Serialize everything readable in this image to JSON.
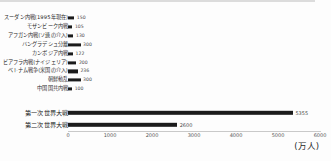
{
  "chart_data": {
    "type": "bar",
    "orientation": "horizontal",
    "title": "",
    "subtitle": "",
    "xlabel": "(万人)",
    "ylabel": "",
    "xlim": [
      0,
      6000
    ],
    "xticks": [
      "0",
      "1000",
      "2000",
      "3000",
      "4000",
      "5000",
      "6000"
    ],
    "grid": false,
    "legend": "none",
    "unit_note": "(万人)",
    "categories": [
      "スーダン内戦(1995年現在)",
      "モザンビーク内戦",
      "アフガン内戦(ソ連の介入)",
      "バングラデシュ分離",
      "カンボジア内戦",
      "ビアフラ内戦(ナイジェリア)",
      "ベトナム戦争(米国の介入)",
      "朝鮮動乱",
      "中国国共内戦",
      "第一次世界大戦",
      "第二次世界大戦"
    ],
    "values": [
      150,
      105,
      130,
      300,
      122,
      200,
      236,
      300,
      100,
      5355,
      2600
    ],
    "value_labels": [
      "150",
      "105",
      "130",
      "300",
      "122",
      "200",
      "236",
      "300",
      "100",
      "5355",
      "2600"
    ]
  },
  "rows": [
    {
      "label": "スーダン内戦(1995年現在)",
      "value": 150,
      "value_label": "150"
    },
    {
      "label": "モザンビーク内戦",
      "value": 105,
      "value_label": "105"
    },
    {
      "label": "アフガン内戦(ソ連の介入)",
      "value": 130,
      "value_label": "130"
    },
    {
      "label": "バングラデシュ分離",
      "value": 300,
      "value_label": "300"
    },
    {
      "label": "カンボジア内戦",
      "value": 122,
      "value_label": "122"
    },
    {
      "label": "ビアフラ内戦(ナイジェリア)",
      "value": 200,
      "value_label": "200"
    },
    {
      "label": "ベトナム戦争(米国の介入)",
      "value": 236,
      "value_label": "236"
    },
    {
      "label": "朝鮮動乱",
      "value": 300,
      "value_label": "300"
    },
    {
      "label": "中国国共内戦",
      "value": 100,
      "value_label": "100"
    },
    {
      "label": "第一次世界大戦",
      "value": 5355,
      "value_label": "5355"
    },
    {
      "label": "第二次世界大戦",
      "value": 2600,
      "value_label": "2600"
    }
  ],
  "axis": {
    "ticks": [
      "0",
      "1000",
      "2000",
      "3000",
      "4000",
      "5000",
      "6000"
    ],
    "unit": "(万人)"
  },
  "colors": {
    "bar": "#1b1b1b",
    "label_text": "#2b2b2b",
    "value_text": "#4a4a4a",
    "axis": "#c9c9c9",
    "background": "#fdfdfd"
  }
}
